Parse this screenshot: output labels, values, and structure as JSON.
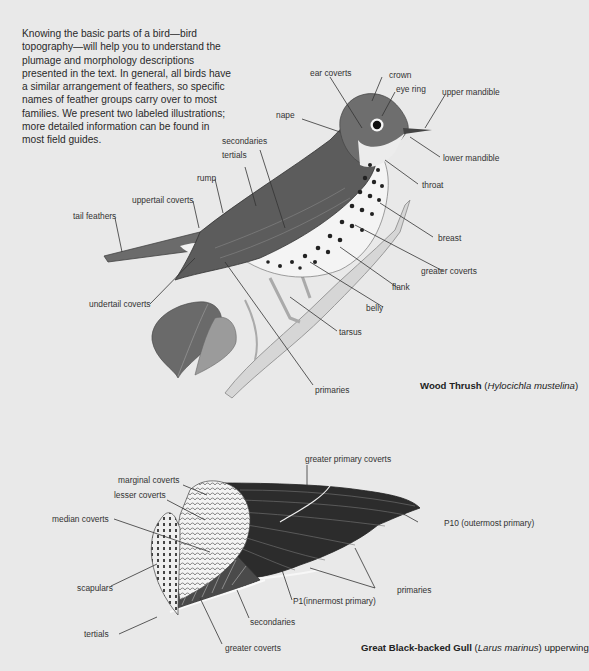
{
  "intro_text": "Knowing the basic parts of a bird—bird topography—will help you to understand the plumage and morphology descriptions presented in the text. In general, all birds have a similar arrangement of feathers, so specific names of feather groups carry over to most families. We present two labeled illustrations; more detailed information can be found in most field guides.",
  "thrush": {
    "caption": {
      "common": "Wood Thrush",
      "open": " (",
      "scientific": "Hylocichla mustelina",
      "close": ")",
      "suffix": ""
    },
    "labels": {
      "ear_coverts": "ear coverts",
      "crown": "crown",
      "eye_ring": "eye ring",
      "upper_mandible": "upper mandible",
      "nape": "nape",
      "lower_mandible": "lower mandible",
      "secondaries": "secondaries",
      "tertials": "tertials",
      "rump": "rump",
      "throat": "throat",
      "uppertail_coverts": "uppertail coverts",
      "tail_feathers": "tail feathers",
      "breast": "breast",
      "greater_coverts": "greater coverts",
      "flank": "flank",
      "undertail_coverts": "undertail coverts",
      "belly": "belly",
      "tarsus": "tarsus",
      "primaries": "primaries"
    }
  },
  "gull": {
    "caption": {
      "common": "Great Black-backed Gull",
      "open": " (",
      "scientific": "Larus marinus",
      "close": ")",
      "suffix": " upperwing"
    },
    "labels": {
      "greater_primary_coverts": "greater primary coverts",
      "marginal_coverts": "marginal coverts",
      "lesser_coverts": "lesser coverts",
      "median_coverts": "median coverts",
      "p10": "P10 (outermost primary)",
      "scapulars": "scapulars",
      "primaries": "primaries",
      "p1": "P1(innermost primary)",
      "secondaries": "secondaries",
      "tertials": "tertials",
      "greater_coverts": "greater coverts"
    }
  }
}
